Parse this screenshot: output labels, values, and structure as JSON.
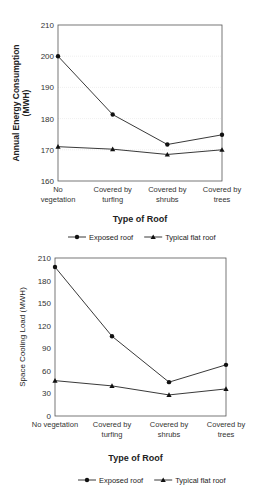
{
  "chart_data": [
    {
      "type": "line",
      "title": "",
      "xlabel": "Type of Roof",
      "ylabel": "Annual Energy Consumption (MWH)",
      "ylabel_lines": [
        "Annual Energy Consumption",
        "(MWH)"
      ],
      "ylim": [
        160,
        210
      ],
      "yticks": [
        160,
        170,
        180,
        190,
        200,
        210
      ],
      "grid": true,
      "legend_position": "bottom",
      "categories": [
        "No vegetation",
        "Covered by turfing",
        "Covered by shrubs",
        "Covered by trees"
      ],
      "category_lines": [
        [
          "No",
          "vegetation"
        ],
        [
          "Covered by",
          "turfing"
        ],
        [
          "Covered by",
          "shrubs"
        ],
        [
          "Covered by",
          "trees"
        ]
      ],
      "series": [
        {
          "name": "Exposed roof",
          "marker": "circle",
          "values": [
            200,
            181.3,
            171.7,
            174.8
          ]
        },
        {
          "name": "Typical flat roof",
          "marker": "triangle",
          "values": [
            171,
            170.2,
            168.5,
            170
          ]
        }
      ]
    },
    {
      "type": "line",
      "title": "",
      "xlabel": "Type of Roof",
      "ylabel": "Space Cooling Load (MWH)",
      "ylim": [
        0,
        210
      ],
      "yticks": [
        0,
        30,
        60,
        90,
        120,
        150,
        180,
        210
      ],
      "grid": false,
      "legend_position": "bottom",
      "categories": [
        "No vegetation",
        "Covered by turfing",
        "Covered by shrubs",
        "Covered by trees"
      ],
      "category_lines": [
        [
          "No vegetation"
        ],
        [
          "Covered by",
          "turfing"
        ],
        [
          "Covered by",
          "shrubs"
        ],
        [
          "Covered by",
          "trees"
        ]
      ],
      "series": [
        {
          "name": "Exposed roof",
          "marker": "circle",
          "values": [
            198,
            106,
            45,
            68
          ]
        },
        {
          "name": "Typical flat roof",
          "marker": "triangle",
          "values": [
            47,
            40,
            28,
            36
          ]
        }
      ]
    }
  ]
}
